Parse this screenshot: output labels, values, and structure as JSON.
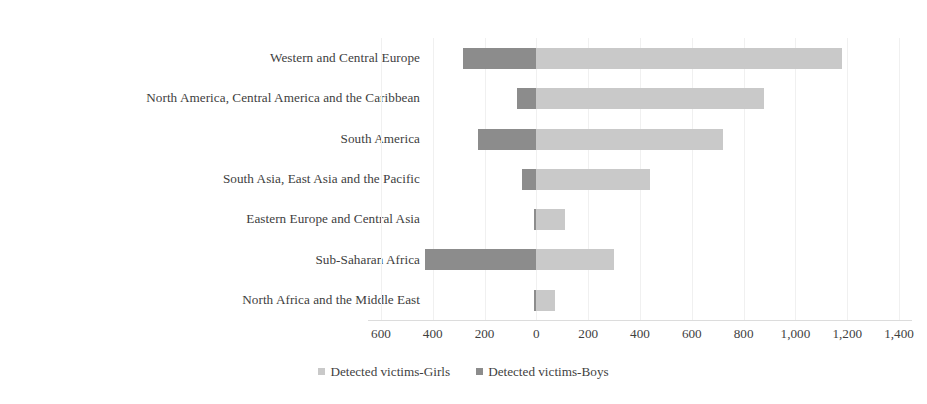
{
  "chart_data": {
    "type": "bar",
    "orientation": "horizontal",
    "stacked": true,
    "diverging": true,
    "title": "",
    "subtitle": "",
    "xlabel": "",
    "ylabel": "",
    "grid": true,
    "legend_position": "bottom",
    "categories": [
      "Western and Central Europe",
      "North America, Central America and the Caribbean",
      "South America",
      "South Asia, East Asia and the Pacific",
      "Eastern Europe and Central Asia",
      "Sub-Saharan Africa",
      "North Africa and the Middle East"
    ],
    "series": [
      {
        "name": "Detected victims-Boys",
        "color": "#8c8c8c",
        "direction": "left",
        "values": [
          285,
          75,
          225,
          55,
          10,
          430,
          10
        ]
      },
      {
        "name": "Detected victims-Girls",
        "color": "#c9c9c9",
        "direction": "right",
        "values": [
          1180,
          880,
          720,
          440,
          110,
          300,
          70
        ]
      }
    ],
    "axis": {
      "tick_labels": [
        "600",
        "400",
        "200",
        "0",
        "200",
        "400",
        "600",
        "800",
        "1,000",
        "1,200",
        "1,400"
      ],
      "tick_values": [
        -600,
        -400,
        -200,
        0,
        200,
        400,
        600,
        800,
        1000,
        1200,
        1400
      ],
      "xlim": [
        -650,
        1450
      ],
      "zero_at": 0
    }
  },
  "legend": {
    "items": [
      {
        "label": "Detected victims-Girls",
        "color": "#c9c9c9"
      },
      {
        "label": "Detected victims-Boys",
        "color": "#8c8c8c"
      }
    ]
  }
}
